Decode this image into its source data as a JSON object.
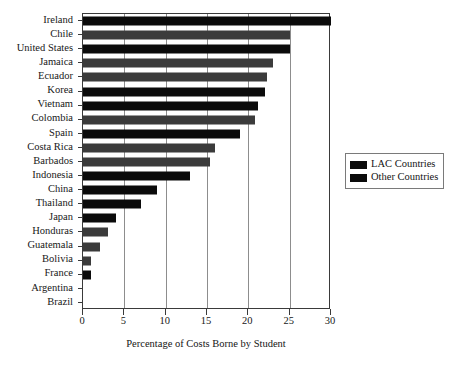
{
  "chart_data": {
    "type": "bar",
    "orientation": "horizontal",
    "title": "",
    "xlabel": "Percentage of Costs Borne by Student",
    "ylabel": "",
    "xlim": [
      0,
      30
    ],
    "xticks": [
      0,
      5,
      10,
      15,
      20,
      25,
      30
    ],
    "xticklabels": [
      "0",
      "5",
      "10",
      "15",
      "20",
      "25",
      "30"
    ],
    "grid": true,
    "grid_axis": "x",
    "legend_position": "right",
    "categories": [
      "Ireland",
      "Chile",
      "United States",
      "Jamaica",
      "Ecuador",
      "Korea",
      "Vietnam",
      "Colombia",
      "Spain",
      "Costa Rica",
      "Barbados",
      "Indonesia",
      "China",
      "Thailand",
      "Japan",
      "Honduras",
      "Guatemala",
      "Bolivia",
      "France",
      "Argentina",
      "Brazil"
    ],
    "values": [
      30,
      25,
      25,
      23,
      22.3,
      22,
      21.2,
      20.8,
      19,
      16,
      15.4,
      13,
      9,
      7,
      4,
      3,
      2,
      1,
      1,
      0,
      0
    ],
    "groups": [
      "Other Countries",
      "LAC Countries",
      "Other Countries",
      "LAC Countries",
      "LAC Countries",
      "Other Countries",
      "Other Countries",
      "LAC Countries",
      "Other Countries",
      "LAC Countries",
      "LAC Countries",
      "Other Countries",
      "Other Countries",
      "Other Countries",
      "Other Countries",
      "LAC Countries",
      "LAC Countries",
      "LAC Countries",
      "Other Countries",
      "LAC Countries",
      "LAC Countries"
    ],
    "legend": [
      {
        "label": "LAC Countries",
        "color": "#3b3b3b"
      },
      {
        "label": "Other Countries",
        "color": "#0b0b0b"
      }
    ]
  }
}
